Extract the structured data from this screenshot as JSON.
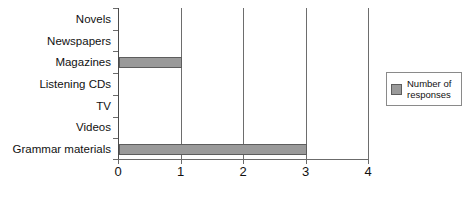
{
  "chart_data": {
    "type": "bar",
    "orientation": "horizontal",
    "title": "",
    "xlabel": "",
    "ylabel": "",
    "categories": [
      "Novels",
      "Newspapers",
      "Magazines",
      "Listening CDs",
      "TV",
      "Videos",
      "Grammar materials"
    ],
    "values": [
      0,
      0,
      1,
      0,
      0,
      0,
      3
    ],
    "series": [
      {
        "name": "Number of responses",
        "values": [
          0,
          0,
          1,
          0,
          0,
          0,
          3
        ]
      }
    ],
    "xlim": [
      0,
      4
    ],
    "xticks": [
      0,
      1,
      2,
      3,
      4
    ],
    "xtick_labels": [
      "0",
      "1",
      "2",
      "3",
      "4"
    ],
    "grid": true,
    "grid_axis": "x",
    "legend": {
      "position": "right",
      "entries": [
        {
          "label": "Number of responses",
          "color": "#9a9a9a"
        }
      ]
    },
    "colors": {
      "bar_fill": "#9a9a9a",
      "bar_border": "#5d5d5d",
      "axis": "#6b6b6b",
      "grid": "#6d6d6d",
      "text": "#111111",
      "background": "#ffffff"
    }
  }
}
